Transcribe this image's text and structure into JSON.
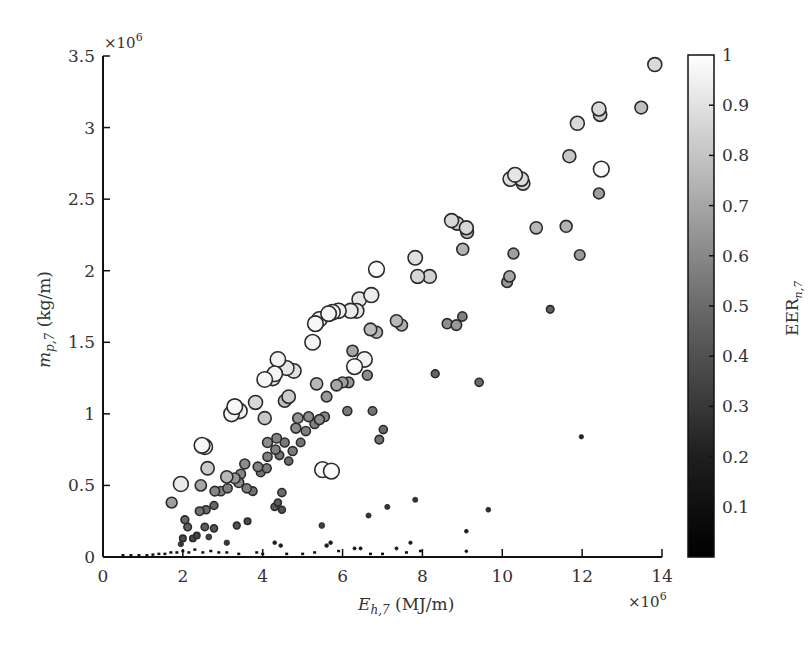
{
  "chart_data": {
    "type": "scatter",
    "title": "",
    "xlabel": "E_h,7 (MJ/m)",
    "xlabel_main": "E",
    "xlabel_sub": "h,7",
    "xlabel_unit": " (MJ/m)",
    "x_multiplier": "×10^6",
    "ylabel": "m_p,7 (kg/m)",
    "ylabel_main": "m",
    "ylabel_sub": "p,7",
    "ylabel_unit": " (kg/m)",
    "y_multiplier": "×10^6",
    "xlim": [
      0,
      14
    ],
    "ylim": [
      0,
      3.5
    ],
    "x_ticks": [
      "0",
      "2",
      "4",
      "6",
      "8",
      "10",
      "12",
      "14"
    ],
    "y_ticks": [
      "0",
      "0.5",
      "1",
      "1.5",
      "2",
      "2.5",
      "3",
      "3.5"
    ],
    "grid": false,
    "colorbar": {
      "label": "EER_n,7",
      "label_main": "EER",
      "label_sub": "n,7",
      "range": [
        0,
        1
      ],
      "ticks": [
        "0.1",
        "0.2",
        "0.3",
        "0.4",
        "0.5",
        "0.6",
        "0.7",
        "0.8",
        "0.9",
        "1"
      ],
      "colormap": "gray",
      "color_low": "#000000",
      "color_high": "#ffffff"
    },
    "marker_note": "marker size and grayscale both encode EER_n,7",
    "points": [
      {
        "x": 13.82,
        "y": 3.44,
        "eer": 0.85
      },
      {
        "x": 12.42,
        "y": 3.13,
        "eer": 0.85
      },
      {
        "x": 12.45,
        "y": 3.09,
        "eer": 0.8
      },
      {
        "x": 13.48,
        "y": 3.14,
        "eer": 0.75
      },
      {
        "x": 11.88,
        "y": 3.03,
        "eer": 0.85
      },
      {
        "x": 11.68,
        "y": 2.8,
        "eer": 0.78
      },
      {
        "x": 12.48,
        "y": 2.71,
        "eer": 0.98
      },
      {
        "x": 12.42,
        "y": 2.54,
        "eer": 0.62
      },
      {
        "x": 10.32,
        "y": 2.67,
        "eer": 0.9
      },
      {
        "x": 10.2,
        "y": 2.64,
        "eer": 0.88
      },
      {
        "x": 10.48,
        "y": 2.64,
        "eer": 0.86
      },
      {
        "x": 10.52,
        "y": 2.61,
        "eer": 0.82
      },
      {
        "x": 8.73,
        "y": 2.35,
        "eer": 0.85
      },
      {
        "x": 8.87,
        "y": 2.33,
        "eer": 0.8
      },
      {
        "x": 9.1,
        "y": 2.3,
        "eer": 0.84
      },
      {
        "x": 9.12,
        "y": 2.27,
        "eer": 0.76
      },
      {
        "x": 10.85,
        "y": 2.3,
        "eer": 0.72
      },
      {
        "x": 11.6,
        "y": 2.31,
        "eer": 0.7
      },
      {
        "x": 9.01,
        "y": 2.15,
        "eer": 0.7
      },
      {
        "x": 10.28,
        "y": 2.12,
        "eer": 0.62
      },
      {
        "x": 11.94,
        "y": 2.11,
        "eer": 0.6
      },
      {
        "x": 7.82,
        "y": 2.09,
        "eer": 0.88
      },
      {
        "x": 6.85,
        "y": 2.01,
        "eer": 0.98
      },
      {
        "x": 7.88,
        "y": 1.96,
        "eer": 0.84
      },
      {
        "x": 8.18,
        "y": 1.96,
        "eer": 0.82
      },
      {
        "x": 10.18,
        "y": 1.96,
        "eer": 0.65
      },
      {
        "x": 10.12,
        "y": 1.92,
        "eer": 0.6
      },
      {
        "x": 6.72,
        "y": 1.83,
        "eer": 0.92
      },
      {
        "x": 6.42,
        "y": 1.8,
        "eer": 0.9
      },
      {
        "x": 5.9,
        "y": 1.72,
        "eer": 0.94
      },
      {
        "x": 5.65,
        "y": 1.7,
        "eer": 0.96
      },
      {
        "x": 5.75,
        "y": 1.71,
        "eer": 0.95
      },
      {
        "x": 6.2,
        "y": 1.72,
        "eer": 0.92
      },
      {
        "x": 6.35,
        "y": 1.72,
        "eer": 0.9
      },
      {
        "x": 5.32,
        "y": 1.63,
        "eer": 0.97
      },
      {
        "x": 5.42,
        "y": 1.66,
        "eer": 0.95
      },
      {
        "x": 5.25,
        "y": 1.5,
        "eer": 0.96
      },
      {
        "x": 7.35,
        "y": 1.65,
        "eer": 0.72
      },
      {
        "x": 7.48,
        "y": 1.62,
        "eer": 0.68
      },
      {
        "x": 6.7,
        "y": 1.59,
        "eer": 0.74
      },
      {
        "x": 6.85,
        "y": 1.57,
        "eer": 0.7
      },
      {
        "x": 8.62,
        "y": 1.63,
        "eer": 0.56
      },
      {
        "x": 8.85,
        "y": 1.62,
        "eer": 0.6
      },
      {
        "x": 9.0,
        "y": 1.68,
        "eer": 0.5
      },
      {
        "x": 6.25,
        "y": 1.44,
        "eer": 0.65
      },
      {
        "x": 6.3,
        "y": 1.33,
        "eer": 0.98
      },
      {
        "x": 6.55,
        "y": 1.38,
        "eer": 0.95
      },
      {
        "x": 6.62,
        "y": 1.27,
        "eer": 0.55
      },
      {
        "x": 11.2,
        "y": 1.73,
        "eer": 0.38
      },
      {
        "x": 4.38,
        "y": 1.38,
        "eer": 0.95
      },
      {
        "x": 4.3,
        "y": 1.28,
        "eer": 0.96
      },
      {
        "x": 4.6,
        "y": 1.32,
        "eer": 0.9
      },
      {
        "x": 4.78,
        "y": 1.3,
        "eer": 0.88
      },
      {
        "x": 4.05,
        "y": 1.24,
        "eer": 0.96
      },
      {
        "x": 4.25,
        "y": 1.25,
        "eer": 0.93
      },
      {
        "x": 5.35,
        "y": 1.21,
        "eer": 0.72
      },
      {
        "x": 5.85,
        "y": 1.2,
        "eer": 0.65
      },
      {
        "x": 6.0,
        "y": 1.22,
        "eer": 0.62
      },
      {
        "x": 6.15,
        "y": 1.22,
        "eer": 0.6
      },
      {
        "x": 4.65,
        "y": 1.12,
        "eer": 0.8
      },
      {
        "x": 4.55,
        "y": 1.09,
        "eer": 0.75
      },
      {
        "x": 3.82,
        "y": 1.08,
        "eer": 0.85
      },
      {
        "x": 3.3,
        "y": 1.05,
        "eer": 0.97
      },
      {
        "x": 3.22,
        "y": 1.0,
        "eer": 0.96
      },
      {
        "x": 3.42,
        "y": 1.02,
        "eer": 0.94
      },
      {
        "x": 5.6,
        "y": 1.12,
        "eer": 0.6
      },
      {
        "x": 4.05,
        "y": 0.97,
        "eer": 0.78
      },
      {
        "x": 4.88,
        "y": 0.97,
        "eer": 0.58
      },
      {
        "x": 5.15,
        "y": 0.98,
        "eer": 0.55
      },
      {
        "x": 5.42,
        "y": 0.96,
        "eer": 0.55
      },
      {
        "x": 5.55,
        "y": 0.98,
        "eer": 0.52
      },
      {
        "x": 6.12,
        "y": 1.02,
        "eer": 0.48
      },
      {
        "x": 6.75,
        "y": 1.02,
        "eer": 0.45
      },
      {
        "x": 4.83,
        "y": 0.9,
        "eer": 0.55
      },
      {
        "x": 5.08,
        "y": 0.88,
        "eer": 0.5
      },
      {
        "x": 5.3,
        "y": 0.93,
        "eer": 0.5
      },
      {
        "x": 7.02,
        "y": 0.89,
        "eer": 0.42
      },
      {
        "x": 6.92,
        "y": 0.82,
        "eer": 0.45
      },
      {
        "x": 4.35,
        "y": 0.83,
        "eer": 0.52
      },
      {
        "x": 4.12,
        "y": 0.8,
        "eer": 0.55
      },
      {
        "x": 4.55,
        "y": 0.8,
        "eer": 0.48
      },
      {
        "x": 4.32,
        "y": 0.75,
        "eer": 0.5
      },
      {
        "x": 4.75,
        "y": 0.74,
        "eer": 0.48
      },
      {
        "x": 4.95,
        "y": 0.8,
        "eer": 0.45
      },
      {
        "x": 4.12,
        "y": 0.7,
        "eer": 0.5
      },
      {
        "x": 4.42,
        "y": 0.71,
        "eer": 0.45
      },
      {
        "x": 4.65,
        "y": 0.67,
        "eer": 0.42
      },
      {
        "x": 3.55,
        "y": 0.65,
        "eer": 0.55
      },
      {
        "x": 3.88,
        "y": 0.63,
        "eer": 0.52
      },
      {
        "x": 4.1,
        "y": 0.62,
        "eer": 0.48
      },
      {
        "x": 3.45,
        "y": 0.58,
        "eer": 0.52
      },
      {
        "x": 3.95,
        "y": 0.59,
        "eer": 0.45
      },
      {
        "x": 2.55,
        "y": 0.77,
        "eer": 0.95
      },
      {
        "x": 2.48,
        "y": 0.78,
        "eer": 0.97
      },
      {
        "x": 2.62,
        "y": 0.62,
        "eer": 0.8
      },
      {
        "x": 3.1,
        "y": 0.56,
        "eer": 0.72
      },
      {
        "x": 3.3,
        "y": 0.55,
        "eer": 0.6
      },
      {
        "x": 3.4,
        "y": 0.52,
        "eer": 0.55
      },
      {
        "x": 3.6,
        "y": 0.48,
        "eer": 0.5
      },
      {
        "x": 3.75,
        "y": 0.46,
        "eer": 0.45
      },
      {
        "x": 4.48,
        "y": 0.45,
        "eer": 0.42
      },
      {
        "x": 5.5,
        "y": 0.61,
        "eer": 0.98
      },
      {
        "x": 5.72,
        "y": 0.6,
        "eer": 0.98
      },
      {
        "x": 1.95,
        "y": 0.51,
        "eer": 0.92
      },
      {
        "x": 1.72,
        "y": 0.38,
        "eer": 0.62
      },
      {
        "x": 2.45,
        "y": 0.5,
        "eer": 0.65
      },
      {
        "x": 2.8,
        "y": 0.46,
        "eer": 0.52
      },
      {
        "x": 2.95,
        "y": 0.46,
        "eer": 0.5
      },
      {
        "x": 3.12,
        "y": 0.48,
        "eer": 0.5
      },
      {
        "x": 2.42,
        "y": 0.32,
        "eer": 0.45
      },
      {
        "x": 2.58,
        "y": 0.33,
        "eer": 0.42
      },
      {
        "x": 2.78,
        "y": 0.36,
        "eer": 0.4
      },
      {
        "x": 4.3,
        "y": 0.35,
        "eer": 0.35
      },
      {
        "x": 4.38,
        "y": 0.38,
        "eer": 0.35
      },
      {
        "x": 4.48,
        "y": 0.33,
        "eer": 0.33
      },
      {
        "x": 2.05,
        "y": 0.26,
        "eer": 0.4
      },
      {
        "x": 2.12,
        "y": 0.21,
        "eer": 0.38
      },
      {
        "x": 2.55,
        "y": 0.21,
        "eer": 0.36
      },
      {
        "x": 2.78,
        "y": 0.2,
        "eer": 0.34
      },
      {
        "x": 3.35,
        "y": 0.22,
        "eer": 0.32
      },
      {
        "x": 3.62,
        "y": 0.25,
        "eer": 0.3
      },
      {
        "x": 5.48,
        "y": 0.22,
        "eer": 0.25
      },
      {
        "x": 2.0,
        "y": 0.13,
        "eer": 0.3
      },
      {
        "x": 2.25,
        "y": 0.13,
        "eer": 0.28
      },
      {
        "x": 2.35,
        "y": 0.15,
        "eer": 0.28
      },
      {
        "x": 2.65,
        "y": 0.14,
        "eer": 0.26
      },
      {
        "x": 3.1,
        "y": 0.1,
        "eer": 0.22
      },
      {
        "x": 1.95,
        "y": 0.09,
        "eer": 0.22
      },
      {
        "x": 6.65,
        "y": 0.29,
        "eer": 0.2
      },
      {
        "x": 7.12,
        "y": 0.35,
        "eer": 0.2
      },
      {
        "x": 7.82,
        "y": 0.4,
        "eer": 0.2
      },
      {
        "x": 8.32,
        "y": 1.28,
        "eer": 0.4
      },
      {
        "x": 9.42,
        "y": 1.22,
        "eer": 0.42
      },
      {
        "x": 9.65,
        "y": 0.33,
        "eer": 0.18
      },
      {
        "x": 11.98,
        "y": 0.84,
        "eer": 0.15
      },
      {
        "x": 9.1,
        "y": 0.18,
        "eer": 0.1
      },
      {
        "x": 4.3,
        "y": 0.1,
        "eer": 0.1
      },
      {
        "x": 4.45,
        "y": 0.08,
        "eer": 0.1
      },
      {
        "x": 5.6,
        "y": 0.08,
        "eer": 0.1
      },
      {
        "x": 5.7,
        "y": 0.1,
        "eer": 0.1
      },
      {
        "x": 7.7,
        "y": 0.1,
        "eer": 0.08
      },
      {
        "x": 7.35,
        "y": 0.06,
        "eer": 0.06
      },
      {
        "x": 6.3,
        "y": 0.06,
        "eer": 0.06
      },
      {
        "x": 6.45,
        "y": 0.06,
        "eer": 0.06
      },
      {
        "x": 9.1,
        "y": 0.04,
        "eer": 0.03
      }
    ],
    "near_zero_points": [
      {
        "x": 0.5,
        "y": 0.01
      },
      {
        "x": 0.7,
        "y": 0.01
      },
      {
        "x": 0.9,
        "y": 0.01
      },
      {
        "x": 1.1,
        "y": 0.01
      },
      {
        "x": 1.25,
        "y": 0.015
      },
      {
        "x": 1.4,
        "y": 0.02
      },
      {
        "x": 1.55,
        "y": 0.02
      },
      {
        "x": 1.7,
        "y": 0.03
      },
      {
        "x": 1.85,
        "y": 0.03
      },
      {
        "x": 2.0,
        "y": 0.04
      },
      {
        "x": 2.15,
        "y": 0.03
      },
      {
        "x": 2.3,
        "y": 0.05
      },
      {
        "x": 2.5,
        "y": 0.03
      },
      {
        "x": 2.7,
        "y": 0.04
      },
      {
        "x": 2.9,
        "y": 0.03
      },
      {
        "x": 3.1,
        "y": 0.03
      },
      {
        "x": 3.4,
        "y": 0.02
      },
      {
        "x": 3.85,
        "y": 0.03
      },
      {
        "x": 4.0,
        "y": 0.02
      },
      {
        "x": 4.6,
        "y": 0.02
      },
      {
        "x": 5.0,
        "y": 0.02
      },
      {
        "x": 5.3,
        "y": 0.03
      },
      {
        "x": 5.9,
        "y": 0.04
      },
      {
        "x": 6.7,
        "y": 0.02
      },
      {
        "x": 7.0,
        "y": 0.02
      },
      {
        "x": 7.6,
        "y": 0.03
      },
      {
        "x": 7.95,
        "y": 0.04
      }
    ]
  }
}
